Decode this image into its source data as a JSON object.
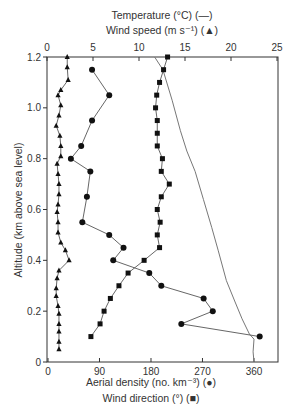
{
  "chart_data": {
    "type": "line",
    "title": "",
    "top_axis": {
      "label_line1": "Temperature (°C) (—)",
      "label_line2": "Wind speed (m s⁻¹) (▲)",
      "range": [
        0,
        25
      ],
      "ticks": [
        "0",
        "5",
        "10",
        "15",
        "20",
        "25"
      ]
    },
    "bottom_axis": {
      "label_line1": "Aerial density (no. km⁻³) (●)",
      "label_line2": "Wind direction (°) (■)",
      "range": [
        0,
        402
      ],
      "ticks": [
        "0",
        "90",
        "180",
        "270",
        "360"
      ]
    },
    "left_axis": {
      "label": "Altitude (km above sea level)",
      "range": [
        0,
        1.2
      ],
      "ticks": [
        "0",
        "0.2",
        "0.4",
        "0.6",
        "0.8",
        "1.0",
        "1.2"
      ]
    },
    "grid": false,
    "series": [
      {
        "name": "Temperature (°C)",
        "axis": "top",
        "marker": "none",
        "points": [
          [
            11.7,
            1.2
          ],
          [
            12.6,
            1.15
          ],
          [
            13.6,
            1.03
          ],
          [
            14.5,
            0.91
          ],
          [
            15.2,
            0.83
          ],
          [
            16.1,
            0.75
          ],
          [
            17.0,
            0.64
          ],
          [
            17.9,
            0.53
          ],
          [
            18.6,
            0.44
          ],
          [
            19.5,
            0.32
          ],
          [
            20.4,
            0.24
          ],
          [
            21.2,
            0.17
          ],
          [
            22.0,
            0.11
          ],
          [
            22.5,
            0.09
          ],
          [
            22.4,
            0.04
          ],
          [
            22.5,
            0.0
          ]
        ]
      },
      {
        "name": "Wind speed (m s⁻¹)",
        "axis": "top",
        "marker": "triangle",
        "points": [
          [
            2.2,
            1.2
          ],
          [
            2.2,
            1.16
          ],
          [
            2.3,
            1.11
          ],
          [
            1.5,
            1.07
          ],
          [
            1.2,
            1.05
          ],
          [
            1.5,
            1.01
          ],
          [
            1.3,
            0.97
          ],
          [
            1.0,
            0.93
          ],
          [
            1.4,
            0.89
          ],
          [
            1.5,
            0.85
          ],
          [
            1.5,
            0.81
          ],
          [
            1.1,
            0.78
          ],
          [
            1.2,
            0.74
          ],
          [
            1.3,
            0.7
          ],
          [
            1.3,
            0.66
          ],
          [
            1.2,
            0.62
          ],
          [
            1.1,
            0.59
          ],
          [
            1.2,
            0.55
          ],
          [
            1.2,
            0.51
          ],
          [
            1.5,
            0.47
          ],
          [
            2.0,
            0.44
          ],
          [
            2.4,
            0.4
          ],
          [
            1.3,
            0.36
          ],
          [
            1.1,
            0.33
          ],
          [
            1.0,
            0.29
          ],
          [
            1.0,
            0.26
          ],
          [
            1.2,
            0.22
          ],
          [
            1.3,
            0.19
          ],
          [
            1.3,
            0.15
          ],
          [
            1.3,
            0.12
          ],
          [
            1.3,
            0.08
          ],
          [
            1.3,
            0.05
          ]
        ]
      },
      {
        "name": "Aerial density (no. km⁻³)",
        "axis": "bottom",
        "marker": "circle",
        "points": [
          [
            77,
            1.15
          ],
          [
            107,
            1.05
          ],
          [
            77,
            0.95
          ],
          [
            58,
            0.85
          ],
          [
            40,
            0.8
          ],
          [
            74,
            0.75
          ],
          [
            68,
            0.65
          ],
          [
            60,
            0.55
          ],
          [
            107,
            0.5
          ],
          [
            132,
            0.45
          ],
          [
            114,
            0.4
          ],
          [
            177,
            0.35
          ],
          [
            198,
            0.3
          ],
          [
            272,
            0.25
          ],
          [
            288,
            0.2
          ],
          [
            233,
            0.15
          ],
          [
            370,
            0.1
          ]
        ]
      },
      {
        "name": "Wind direction (°)",
        "axis": "bottom",
        "marker": "square",
        "points": [
          [
            209,
            1.2
          ],
          [
            202,
            1.15
          ],
          [
            195,
            1.1
          ],
          [
            190,
            1.05
          ],
          [
            188,
            1.0
          ],
          [
            191,
            0.95
          ],
          [
            191,
            0.9
          ],
          [
            191,
            0.85
          ],
          [
            200,
            0.8
          ],
          [
            198,
            0.75
          ],
          [
            212,
            0.7
          ],
          [
            198,
            0.65
          ],
          [
            191,
            0.6
          ],
          [
            196,
            0.55
          ],
          [
            191,
            0.5
          ],
          [
            195,
            0.45
          ],
          [
            168,
            0.4
          ],
          [
            140,
            0.35
          ],
          [
            124,
            0.3
          ],
          [
            109,
            0.25
          ],
          [
            98,
            0.2
          ],
          [
            91,
            0.15
          ],
          [
            75,
            0.1
          ]
        ]
      }
    ]
  },
  "colors": {
    "axis": "#333333",
    "line": "#555555",
    "marker": "#111111",
    "temperature_line": "#777777"
  }
}
